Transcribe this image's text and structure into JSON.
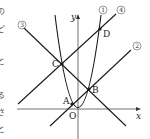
{
  "diagram": {
    "type": "coordinate-plane",
    "axes": {
      "x_label": "x",
      "y_label": "y",
      "origin_label": "O"
    },
    "curves": [
      {
        "id": "1",
        "label": "①",
        "kind": "parabola"
      },
      {
        "id": "2",
        "label": "②",
        "kind": "line"
      },
      {
        "id": "3",
        "label": "③",
        "kind": "line"
      },
      {
        "id": "4",
        "label": "④",
        "kind": "line"
      }
    ],
    "points": [
      {
        "label": "A"
      },
      {
        "label": "B"
      },
      {
        "label": "C"
      },
      {
        "label": "D"
      }
    ],
    "edge_fragments": [
      "の",
      "ど",
      "）",
      "と",
      "）",
      "る",
      "さ",
      "と"
    ],
    "line_color": "#1a1a1a"
  }
}
